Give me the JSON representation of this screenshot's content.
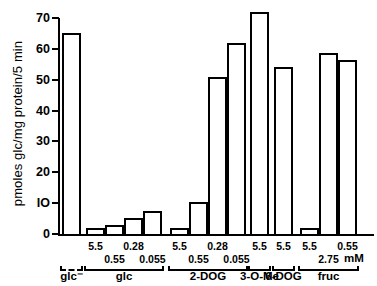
{
  "chart_data": {
    "type": "bar",
    "title": "",
    "xlabel": "mM",
    "ylabel": "pmoles glc/mg protein/5 min",
    "ylim": [
      0,
      70
    ],
    "yticks": [
      0,
      10,
      20,
      30,
      40,
      50,
      60,
      70
    ],
    "ytick_labels": [
      "0",
      "IO",
      "20",
      "30",
      "40",
      "50",
      "60",
      "70"
    ],
    "grid": false,
    "legend": "none",
    "bar_style": "open outline, white fill, black border",
    "groups": [
      {
        "label": "glc⁻",
        "bracket": "dashed",
        "concentrations": [
          ""
        ],
        "values": [
          65.0
        ]
      },
      {
        "label": "glc",
        "bracket": "solid",
        "concentrations": [
          "5.5",
          "0.55",
          "0.28",
          "0.055"
        ],
        "values": [
          1.8,
          3.0,
          5.3,
          7.3
        ]
      },
      {
        "label": "2-DOG",
        "bracket": "solid",
        "concentrations": [
          "5.5",
          "0.55",
          "0.28",
          "0.055"
        ],
        "values": [
          2.0,
          10.5,
          51.0,
          62.0
        ]
      },
      {
        "label": "3-O-Me",
        "bracket": "solid",
        "concentrations": [
          "5.5"
        ],
        "values": [
          72.0
        ]
      },
      {
        "label": "6-DOG",
        "bracket": "solid",
        "concentrations": [
          "5.5"
        ],
        "values": [
          54.0
        ]
      },
      {
        "label": "fruc",
        "bracket": "solid",
        "concentrations": [
          "5.5",
          "2.75",
          "0.55"
        ],
        "values": [
          2.0,
          58.5,
          56.5
        ]
      }
    ],
    "categories": [
      "glc⁻",
      "glc 5.5",
      "glc 0.55",
      "glc 0.28",
      "glc 0.055",
      "2-DOG 5.5",
      "2-DOG 0.55",
      "2-DOG 0.28",
      "2-DOG 0.055",
      "3-O-Me 5.5",
      "6-DOG 5.5",
      "fruc 5.5",
      "fruc 2.75",
      "fruc 0.55"
    ],
    "values": [
      65.0,
      1.8,
      3.0,
      5.3,
      7.3,
      2.0,
      10.5,
      51.0,
      62.0,
      72.0,
      54.0,
      2.0,
      58.5,
      56.5
    ]
  },
  "axis": {
    "y_title": "pmoles glc/mg protein/5 min",
    "x_unit": "mM",
    "ticks": [
      "70",
      "60",
      "50",
      "40",
      "30",
      "20",
      "IO",
      "0"
    ]
  }
}
